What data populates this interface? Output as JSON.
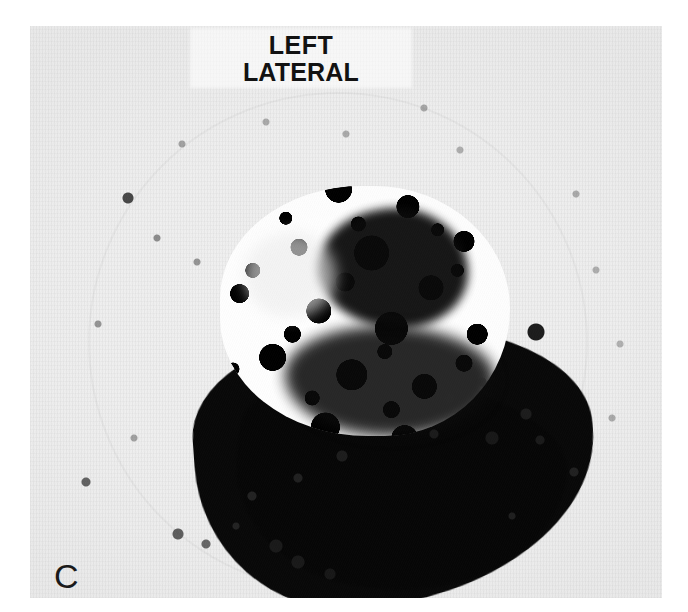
{
  "figure": {
    "panel_letter": "C",
    "modality": "nuclear-medicine-scintigram",
    "background_color": "#f1f1f1",
    "page_color": "#ffffff",
    "uptake_color": "#080808"
  },
  "annotation": {
    "view_label_line1": "LEFT",
    "view_label_line2": "LATERAL",
    "label_color": "#121212"
  },
  "features": {
    "superior_blob_name": "mottled-uptake-region",
    "inferior_mass_name": "dense-confluent-uptake",
    "photopenic_name": "photopenic-defect",
    "focal_dot_name": "focal-hot-spot"
  }
}
